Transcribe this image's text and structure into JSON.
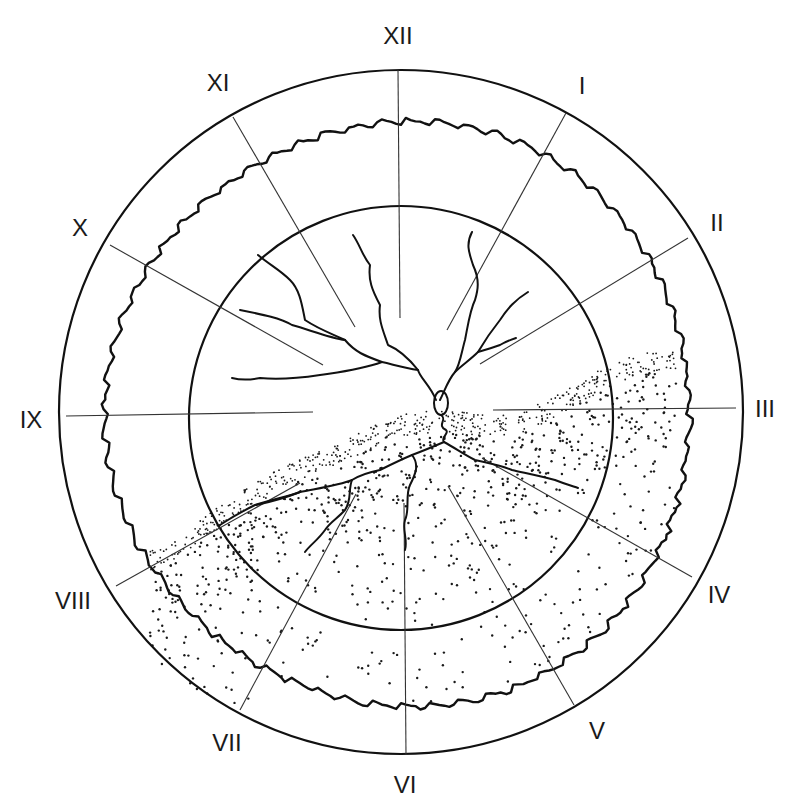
{
  "diagram": {
    "type": "clock-face growth diagram",
    "center": [
      401,
      412
    ],
    "outer_circle_radius": 342,
    "inner_circle": {
      "cx": 401,
      "cy": 418,
      "r": 212
    },
    "jagged_ring": {
      "cx": 401,
      "cy": 414,
      "r": 292,
      "amplitude": 7,
      "teeth": 64
    },
    "colors": {
      "ink": "#111111",
      "background": "#ffffff"
    }
  },
  "hour_labels": [
    {
      "text": "XII",
      "x": 398,
      "y": 38
    },
    {
      "text": "I",
      "x": 582,
      "y": 88
    },
    {
      "text": "II",
      "x": 717,
      "y": 225
    },
    {
      "text": "III",
      "x": 765,
      "y": 411
    },
    {
      "text": "IV",
      "x": 719,
      "y": 597
    },
    {
      "text": "V",
      "x": 597,
      "y": 733
    },
    {
      "text": "VI",
      "x": 405,
      "y": 787
    },
    {
      "text": "VII",
      "x": 227,
      "y": 745
    },
    {
      "text": "VIII",
      "x": 73,
      "y": 603
    },
    {
      "text": "IX",
      "x": 31,
      "y": 422
    },
    {
      "text": "X",
      "x": 80,
      "y": 230
    },
    {
      "text": "XI",
      "x": 218,
      "y": 85
    }
  ],
  "spokes": [
    {
      "hour": "XII",
      "x1": 398,
      "y1": 70,
      "x2": 400,
      "y2": 318
    },
    {
      "hour": "I",
      "x1": 566,
      "y1": 113,
      "x2": 447,
      "y2": 330
    },
    {
      "hour": "II",
      "x1": 688,
      "y1": 238,
      "x2": 480,
      "y2": 364
    },
    {
      "hour": "III",
      "x1": 736,
      "y1": 408,
      "x2": 493,
      "y2": 410
    },
    {
      "hour": "IV",
      "x1": 692,
      "y1": 577,
      "x2": 482,
      "y2": 458
    },
    {
      "hour": "V",
      "x1": 574,
      "y1": 705,
      "x2": 448,
      "y2": 486
    },
    {
      "hour": "VI",
      "x1": 406,
      "y1": 755,
      "x2": 404,
      "y2": 503
    },
    {
      "hour": "VII",
      "x1": 240,
      "y1": 710,
      "x2": 356,
      "y2": 494
    },
    {
      "hour": "VIII",
      "x1": 116,
      "y1": 586,
      "x2": 300,
      "y2": 483
    },
    {
      "hour": "IX",
      "x1": 66,
      "y1": 416,
      "x2": 313,
      "y2": 412
    },
    {
      "hour": "X",
      "x1": 110,
      "y1": 245,
      "x2": 323,
      "y2": 365
    },
    {
      "hour": "XI",
      "x1": 233,
      "y1": 117,
      "x2": 355,
      "y2": 327
    }
  ],
  "upper_branches": [
    "M 436 400 C 430 385, 420 378, 418 370 C 410 360, 400 350, 388 345 C 383 330, 378 320, 380 305 C 372 290, 368 280, 370 265 C 362 255, 360 245, 353 235",
    "M 418 370 C 405 368, 395 365, 382 362 C 365 356, 355 352, 345 340 C 335 335, 320 330, 305 320 C 302 305, 300 290, 290 280 C 280 270, 270 265, 258 255",
    "M 345 340 C 330 338, 310 330, 292 325 C 280 318, 265 315, 240 310",
    "M 382 362 C 360 370, 340 372, 320 375 C 300 378, 280 380, 260 378 C 250 380, 240 380, 232 378",
    "M 440 400 C 445 390, 448 380, 455 372 C 462 365, 470 360, 478 352 C 485 340, 492 330, 500 320 C 508 308, 515 300, 528 292",
    "M 455 372 C 460 365, 462 350, 465 340 C 468 325, 470 310, 475 300 C 478 290, 480 280, 473 265 C 470 255, 465 245, 472 232",
    "M 478 352 C 485 350, 492 348, 500 345 C 505 342, 510 340, 516 338"
  ],
  "knot": {
    "cx": 441,
    "cy": 403,
    "rx": 7,
    "ry": 12
  },
  "lower_branches": [
    "M 441 415 C 448 420, 436 425, 446 430 C 450 433, 440 438, 444 442",
    "M 444 442 C 430 448, 420 452, 412 455 C 400 460, 390 465, 380 470 C 370 472, 360 475, 352 480 C 340 485, 320 488, 300 492 C 290 496, 270 500, 255 505 C 245 510, 235 515, 220 525",
    "M 444 442 C 455 448, 465 455, 475 460 C 488 463, 500 465, 512 470 C 525 473, 540 476, 555 480 C 565 484, 572 486, 578 488",
    "M 412 455 C 420 465, 415 475, 410 485 C 405 495, 410 510, 405 520 C 402 530, 408 540, 405 550",
    "M 352 480 C 348 490, 352 500, 345 510 C 338 518, 330 522, 325 530 C 318 540, 310 545, 305 552",
    "M 300 492 C 285 498, 270 502, 256 505"
  ],
  "stipple_region": {
    "dense_band_width": 22,
    "upper_boundary": [
      [
        160,
        550
      ],
      [
        200,
        520
      ],
      [
        240,
        492
      ],
      [
        280,
        468
      ],
      [
        320,
        450
      ],
      [
        360,
        432
      ],
      [
        400,
        414
      ],
      [
        440,
        410
      ],
      [
        480,
        414
      ],
      [
        520,
        412
      ],
      [
        555,
        396
      ],
      [
        590,
        375
      ],
      [
        625,
        358
      ],
      [
        662,
        347
      ]
    ],
    "right_boundary_x": 676,
    "bottom_follow_outer": true,
    "seed": 7
  }
}
